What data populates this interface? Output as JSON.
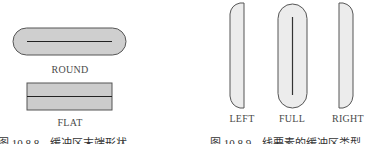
{
  "left_figure": {
    "shapes": [
      {
        "name": "round",
        "label": "ROUND",
        "description": "line buffer with rounded ends"
      },
      {
        "name": "flat",
        "label": "FLAT",
        "description": "line buffer with flat ends"
      }
    ],
    "caption": "图 10.8.8　缓冲区末端形状"
  },
  "right_figure": {
    "shapes": [
      {
        "name": "left",
        "label": "LEFT",
        "description": "buffer on left side of line"
      },
      {
        "name": "full",
        "label": "FULL",
        "description": "buffer on both sides of line"
      },
      {
        "name": "right",
        "label": "RIGHT",
        "description": "buffer on right side of line"
      }
    ],
    "caption": "图 10.8.9　线要素的缓冲区类型"
  },
  "colors": {
    "round_fill": "#cfcfcf",
    "flat_fill": "#cccccc",
    "side_fill": "#ececec",
    "outline": "#555555",
    "line": "#222222"
  }
}
